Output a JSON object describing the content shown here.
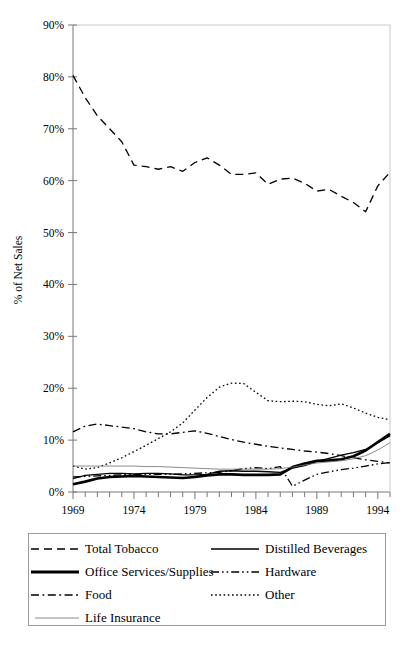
{
  "chart_data": {
    "type": "line",
    "title": "",
    "subtitle": "",
    "xlabel": "",
    "ylabel": "% of Net Sales",
    "xlim": [
      1969,
      1995
    ],
    "ylim": [
      0,
      90
    ],
    "yticks": [
      0,
      10,
      20,
      30,
      40,
      50,
      60,
      70,
      80,
      90
    ],
    "ytick_labels": [
      "0%",
      "10%",
      "20%",
      "30%",
      "40%",
      "50%",
      "60%",
      "70%",
      "80%",
      "90%"
    ],
    "xticks": [
      1969,
      1974,
      1979,
      1984,
      1989,
      1994
    ],
    "xtick_labels": [
      "1969",
      "1974",
      "1979",
      "1984",
      "1989",
      "1994"
    ],
    "x_minor_tick_interval": 1,
    "grid": false,
    "legend_position": "below-plot",
    "legend_columns": 2,
    "x": [
      1969,
      1970,
      1971,
      1972,
      1973,
      1974,
      1975,
      1976,
      1977,
      1978,
      1979,
      1980,
      1981,
      1982,
      1983,
      1984,
      1985,
      1986,
      1987,
      1988,
      1989,
      1990,
      1991,
      1992,
      1993,
      1994,
      1995
    ],
    "series": [
      {
        "name": "Total Tobacco",
        "style": "dashed",
        "width": 1.3,
        "color": "#000000",
        "values": [
          80.3,
          76.0,
          72.5,
          70.0,
          67.5,
          63.0,
          62.7,
          62.2,
          62.7,
          61.8,
          63.5,
          64.4,
          63.0,
          61.2,
          61.2,
          61.5,
          59.3,
          60.3,
          60.5,
          59.5,
          58.0,
          58.3,
          57.0,
          55.8,
          54.0,
          59.0,
          61.6
        ]
      },
      {
        "name": "Distilled Beverages",
        "style": "solid",
        "width": 1.3,
        "color": "#000000",
        "values": [
          2.6,
          3.2,
          3.4,
          3.6,
          3.6,
          3.5,
          3.6,
          3.6,
          3.5,
          3.3,
          3.3,
          3.4,
          4.0,
          4.1,
          4.0,
          4.0,
          3.9,
          3.8,
          4.6,
          5.1,
          5.9,
          6.5,
          7.1,
          7.6,
          8.2,
          9.5,
          10.8
        ]
      },
      {
        "name": "Office Services/Supplies",
        "style": "solid",
        "width": 2.6,
        "color": "#000000",
        "values": [
          1.5,
          2.0,
          2.6,
          2.9,
          3.0,
          3.1,
          3.0,
          2.9,
          2.8,
          2.7,
          2.9,
          3.2,
          3.4,
          3.4,
          3.3,
          3.3,
          3.3,
          3.4,
          4.8,
          5.5,
          6.0,
          6.1,
          6.3,
          6.9,
          8.0,
          9.6,
          11.2
        ]
      },
      {
        "name": "Hardware",
        "style": "dashdotdot",
        "width": 1.3,
        "color": "#000000",
        "values": [
          2.9,
          3.0,
          3.1,
          3.2,
          3.3,
          3.4,
          3.4,
          3.4,
          3.4,
          3.5,
          3.6,
          3.7,
          3.8,
          4.1,
          4.5,
          4.7,
          4.5,
          4.9,
          1.1,
          2.3,
          3.4,
          3.9,
          4.3,
          4.6,
          5.0,
          5.4,
          5.7
        ]
      },
      {
        "name": "Food",
        "style": "dashdot",
        "width": 1.3,
        "color": "#000000",
        "values": [
          11.6,
          12.7,
          13.1,
          12.8,
          12.5,
          12.2,
          11.6,
          11.2,
          11.2,
          11.5,
          11.8,
          11.3,
          10.7,
          10.1,
          9.6,
          9.2,
          8.8,
          8.5,
          8.2,
          7.9,
          7.7,
          7.4,
          7.0,
          6.6,
          6.2,
          5.9,
          5.6
        ]
      },
      {
        "name": "Other",
        "style": "dotted",
        "width": 1.3,
        "color": "#000000",
        "values": [
          5.0,
          4.4,
          4.7,
          5.6,
          6.6,
          7.8,
          9.0,
          10.3,
          11.6,
          13.3,
          15.8,
          18.2,
          20.2,
          21.0,
          20.9,
          19.2,
          17.6,
          17.4,
          17.5,
          17.4,
          16.9,
          16.6,
          17.0,
          16.2,
          15.2,
          14.4,
          13.9
        ]
      },
      {
        "name": "Life Insurance",
        "style": "thin-solid",
        "width": 0.8,
        "color": "#6d6d6d",
        "values": [
          5.0,
          5.0,
          5.0,
          5.0,
          5.0,
          5.0,
          4.9,
          4.9,
          4.8,
          4.7,
          4.6,
          4.5,
          4.4,
          4.4,
          4.4,
          4.4,
          4.4,
          4.5,
          4.8,
          5.2,
          5.6,
          5.8,
          6.0,
          6.4,
          7.0,
          8.1,
          9.5
        ]
      }
    ]
  },
  "legend": {
    "items": [
      {
        "label": "Total Tobacco",
        "style": "dashed",
        "column": 1
      },
      {
        "label": "Distilled Beverages",
        "style": "solid",
        "column": 2
      },
      {
        "label": "Office Services/Supplies",
        "style": "thick-solid",
        "column": 1
      },
      {
        "label": "Hardware",
        "style": "dashdotdot",
        "column": 2
      },
      {
        "label": "Food",
        "style": "dashdot",
        "column": 1
      },
      {
        "label": "Other",
        "style": "dotted",
        "column": 2
      },
      {
        "label": "Life Insurance",
        "style": "thin-solid",
        "column": 1
      }
    ]
  }
}
